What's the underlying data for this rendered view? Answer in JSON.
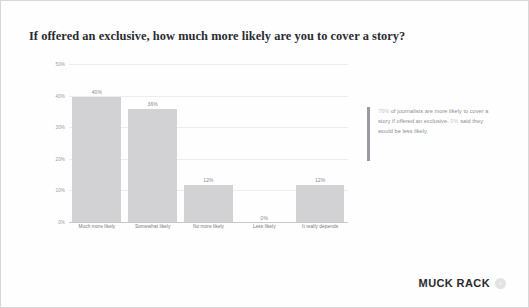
{
  "slide": {
    "title": "If offered an exclusive, how much more likely are you to cover a story?"
  },
  "chart_data": {
    "type": "bar",
    "title": "If offered an exclusive, how much more likely are you to cover a story?",
    "xlabel": "",
    "ylabel": "",
    "categories": [
      "Much more likely",
      "Somewhat likely",
      "No more likely",
      "Less likely",
      "It really depends"
    ],
    "values": [
      40,
      36,
      12,
      0,
      12
    ],
    "value_labels": [
      "40%",
      "36%",
      "12%",
      "0%",
      "12%"
    ],
    "ylim": [
      0,
      50
    ],
    "yticks": [
      50,
      40,
      30,
      20,
      10,
      0
    ],
    "ytick_labels": [
      "50%",
      "40%",
      "30%",
      "20%",
      "10%",
      "0%"
    ],
    "grid": true,
    "legend": false,
    "bar_color": "#d2d2d4"
  },
  "callout": {
    "part1": "76%",
    "part2": " of journalists are more likely to cover a story if offered an exclusive. ",
    "part3": "0%",
    "part4": " said they would be less likely.",
    "accent_color": "#9a9aa2"
  },
  "logo": {
    "text": "MUCK RACK",
    "badge": "•"
  }
}
